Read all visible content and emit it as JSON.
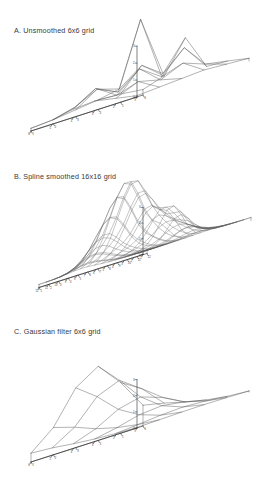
{
  "figure": {
    "background": "#ffffff",
    "line_color": "#555555",
    "axis_color": "#2e2e2e"
  },
  "panels": [
    {
      "id": "a",
      "title": "A. Unsmoothed 6x6 grid",
      "grid": "6x6"
    },
    {
      "id": "b",
      "title": "B. Spline smoothed 16x16 grid",
      "grid": "16x16"
    },
    {
      "id": "c",
      "title": "C. Gaussian filter 6x6 grid",
      "grid": "6x6"
    }
  ],
  "chart_data": [
    {
      "type": "surface",
      "panel": "a",
      "title": "A. Unsmoothed 6x6 grid",
      "nx": 6,
      "ny": 6,
      "xlabel": "",
      "ylabel": "",
      "zlabel": "",
      "grid": true,
      "legend": "none",
      "x_ticks": [
        1,
        2,
        3,
        4,
        5,
        6
      ],
      "y_ticks": [
        1,
        2,
        3,
        4,
        5,
        6
      ],
      "z_ticks": [
        0,
        1,
        2,
        3
      ],
      "zlim": [
        0,
        3
      ],
      "values": [
        [
          0.05,
          0.1,
          0.15,
          0.2,
          0.15,
          0.1
        ],
        [
          0.2,
          0.55,
          0.35,
          0.7,
          0.4,
          0.25
        ],
        [
          0.35,
          0.3,
          1.0,
          0.45,
          1.25,
          0.3
        ],
        [
          0.3,
          0.8,
          0.4,
          2.8,
          0.55,
          1.6
        ],
        [
          0.15,
          0.35,
          0.75,
          0.5,
          1.1,
          0.45
        ],
        [
          0.1,
          0.15,
          0.25,
          0.35,
          0.3,
          0.2
        ]
      ]
    },
    {
      "type": "surface",
      "panel": "b",
      "title": "B. Spline smoothed 16x16 grid",
      "nx": 16,
      "ny": 16,
      "xlabel": "",
      "ylabel": "",
      "zlabel": "",
      "grid": true,
      "legend": "none",
      "x_ticks": [
        1,
        2,
        3,
        4,
        5,
        6,
        7,
        8,
        9,
        10,
        11,
        12,
        13,
        14,
        15,
        16
      ],
      "y_ticks": [
        1,
        2,
        3,
        4,
        5,
        6,
        7,
        8,
        9,
        10,
        11,
        12,
        13,
        14,
        15,
        16
      ],
      "z_ticks": [
        0,
        1,
        2,
        3
      ],
      "zlim": [
        0,
        3
      ],
      "peaks": [
        {
          "cx": 0.5,
          "cy": 0.62,
          "amp": 2.95,
          "sx": 0.13,
          "sy": 0.16
        },
        {
          "cx": 0.8,
          "cy": 0.55,
          "amp": 1.25,
          "sx": 0.09,
          "sy": 0.11
        },
        {
          "cx": 0.22,
          "cy": 0.58,
          "amp": 0.55,
          "sx": 0.12,
          "sy": 0.14
        },
        {
          "cx": 0.62,
          "cy": 0.3,
          "amp": 0.45,
          "sx": 0.12,
          "sy": 0.13
        },
        {
          "cx": 0.36,
          "cy": 0.78,
          "amp": 0.38,
          "sx": 0.1,
          "sy": 0.12
        }
      ],
      "troughs": [
        {
          "cx": 0.45,
          "cy": 0.48,
          "amp": 0.3,
          "sx": 0.16,
          "sy": 0.07
        }
      ],
      "base": 0.12
    },
    {
      "type": "surface",
      "panel": "c",
      "title": "C. Gaussian filter 6x6 grid",
      "nx": 6,
      "ny": 6,
      "xlabel": "",
      "ylabel": "",
      "zlabel": "",
      "grid": true,
      "legend": "none",
      "x_ticks": [
        1,
        2,
        3,
        4,
        5,
        6
      ],
      "y_ticks": [
        1,
        2,
        3,
        4,
        5,
        6
      ],
      "z_ticks": [
        0,
        1,
        2,
        3
      ],
      "zlim": [
        0,
        3
      ],
      "values": [
        [
          0.02,
          0.04,
          0.06,
          0.07,
          0.06,
          0.04
        ],
        [
          0.05,
          0.12,
          0.2,
          0.24,
          0.19,
          0.1
        ],
        [
          0.1,
          0.26,
          0.48,
          0.55,
          0.42,
          0.22
        ],
        [
          0.18,
          0.48,
          0.95,
          1.15,
          0.85,
          0.4
        ],
        [
          0.28,
          0.8,
          1.7,
          2.05,
          1.45,
          0.62
        ],
        [
          0.34,
          1.05,
          2.3,
          2.85,
          1.95,
          0.8
        ]
      ]
    }
  ]
}
